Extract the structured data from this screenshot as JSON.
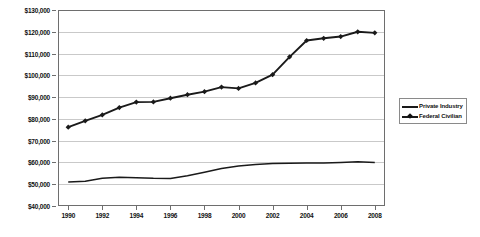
{
  "chart_data": {
    "type": "line",
    "title": "",
    "xlabel": "",
    "ylabel": "",
    "xlim": [
      1989.4,
      2008.6
    ],
    "ylim": [
      40000,
      130000
    ],
    "ytick_step": 10000,
    "grid": true,
    "legend_position": "right-outside",
    "value_prefix": "$",
    "x": [
      1990,
      1991,
      1992,
      1993,
      1994,
      1995,
      1996,
      1997,
      1998,
      1999,
      2000,
      2001,
      2002,
      2003,
      2004,
      2005,
      2006,
      2007,
      2008
    ],
    "xtick_labels": [
      "1990",
      "1992",
      "1994",
      "1996",
      "1998",
      "2000",
      "2002",
      "2004",
      "2006",
      "2008"
    ],
    "xtick_values": [
      1990,
      1992,
      1994,
      1996,
      1998,
      2000,
      2002,
      2004,
      2006,
      2008
    ],
    "ytick_labels": [
      "$40,000",
      "$50,000",
      "$60,000",
      "$70,000",
      "$80,000",
      "$90,000",
      "$100,000",
      "$110,000",
      "$120,000",
      "$130,000"
    ],
    "ytick_values": [
      40000,
      50000,
      60000,
      70000,
      80000,
      90000,
      100000,
      110000,
      120000,
      130000
    ],
    "series": [
      {
        "name": "Private Industry",
        "marker": "none",
        "color": "#1a1a1a",
        "values": [
          51000,
          51400,
          52700,
          53200,
          53000,
          52700,
          52600,
          53900,
          55500,
          57200,
          58400,
          59100,
          59500,
          59600,
          59700,
          59800,
          60000,
          60300,
          60000
        ]
      },
      {
        "name": "Federal Civilian",
        "marker": "diamond",
        "color": "#1a1a1a",
        "values": [
          76200,
          79100,
          81800,
          85200,
          87700,
          87800,
          89500,
          91100,
          92500,
          94600,
          94000,
          96500,
          100300,
          108500,
          116000,
          117000,
          117800,
          120000,
          119500
        ]
      }
    ]
  },
  "legend": {
    "entries": [
      {
        "label": "Private Industry",
        "marker": "none"
      },
      {
        "label": "Federal Civilian",
        "marker": "diamond"
      }
    ]
  },
  "caption": {
    "text": ""
  }
}
